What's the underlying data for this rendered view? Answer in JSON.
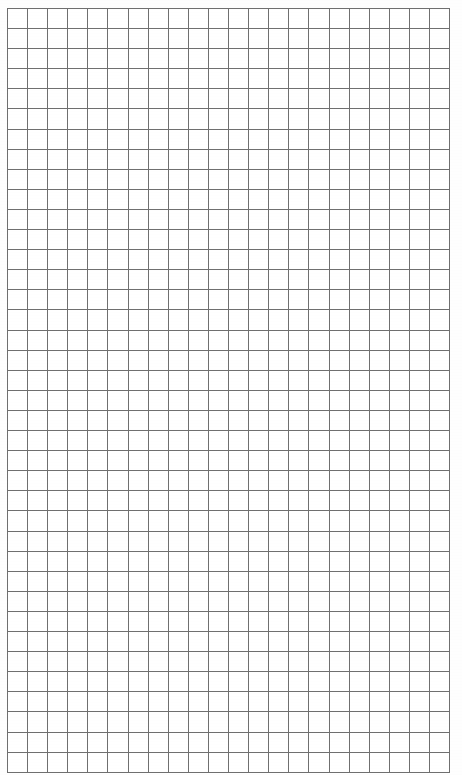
{
  "document": {
    "kind": "graph-paper-sheet",
    "title": "Blank Graph Paper",
    "description": "Blank quadrille / graph paper sheet with a uniform square grid and no printed text or markings.",
    "background_color": "#ffffff",
    "page_width_px": 462,
    "page_height_px": 775
  },
  "grid": {
    "line_color": "#6f6f6f",
    "line_width_px": 1,
    "cell_size_px": 20.1,
    "columns": 22,
    "rows": 38,
    "origin_x_px": 7,
    "origin_y_px": 8,
    "width_px": 441,
    "height_px": 759,
    "right_edge_x_px": 447,
    "bottom_edge_y_px": 766,
    "has_major_gridlines": false,
    "has_labels": false,
    "has_margins": true
  },
  "margins": {
    "left_px": 7,
    "top_px": 8,
    "right_px": 15,
    "bottom_px": 9
  },
  "annotations": {
    "text_content": "",
    "marks_present": false
  }
}
